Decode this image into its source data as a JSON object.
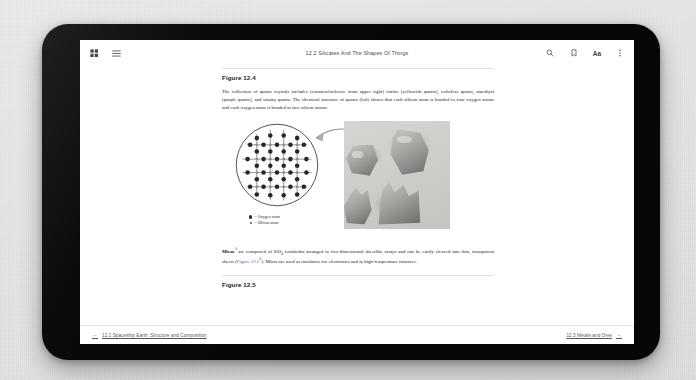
{
  "device": {
    "name": "tablet-device",
    "bezel_color": "#070707",
    "background_color": "#eceaea"
  },
  "header": {
    "title": "12.2 Silicates And The Shapes Of Things",
    "left_icons": [
      {
        "name": "grid-view-icon",
        "label": "Grid view"
      },
      {
        "name": "table-of-contents-icon",
        "label": "Table of contents"
      }
    ],
    "right_icons": [
      {
        "name": "search-icon",
        "label": "Search"
      },
      {
        "name": "bookmark-icon",
        "label": "Bookmark"
      },
      {
        "name": "font-size-icon",
        "label": "Aa"
      },
      {
        "name": "overflow-menu-icon",
        "label": "More options"
      }
    ],
    "font_size_label": "Aa"
  },
  "content": {
    "figure_4": {
      "heading": "Figure 12.4",
      "caption_parts": [
        "The collection of quartz crystals includes (counterclockwise from upper right) citrine (yellowish quartz), colorless quartz, amethyst (purple quartz), and smoky quartz. The chemical structure of quartz (left) shows that each silicon atom is bonded to four oxygen atoms and each oxygen atom is bonded to two silicon atoms."
      ]
    },
    "diagram": {
      "name": "quartz-lattice-diagram",
      "legend": [
        {
          "symbol": "oxygen-atom-dot",
          "text": "= Oxygen atom"
        },
        {
          "symbol": "silicon-atom-dot",
          "text": "= Silicon atom"
        }
      ]
    },
    "photo": {
      "name": "quartz-crystals-photo",
      "alt": "Photograph of four quartz mineral specimens"
    },
    "micas_paragraph": {
      "term": "Micas",
      "ext_mark": "⧉",
      "text_before_link": " are composed of SiO",
      "subscript": "4",
      "text_mid": " tetrahedra arranged in two-dimensional sheetlike arrays and can be easily cleaved into thin, transparent sheets (",
      "link_text": "Figure 12.5",
      "link_mark": "⧉",
      "text_after": "). Micas are used as insulators for electronics and in high-temperature furnaces."
    },
    "figure_5": {
      "heading": "Figure 12.5"
    }
  },
  "bottom_nav": {
    "previous": {
      "arrow": "←",
      "label": "12.1 Spaceship Earth: Structure and Composition"
    },
    "next": {
      "arrow": "→",
      "label": "12.3 Metals and Ores"
    }
  },
  "colors": {
    "link": "#4a6fa5",
    "text": "#232323",
    "muted": "#555555"
  }
}
